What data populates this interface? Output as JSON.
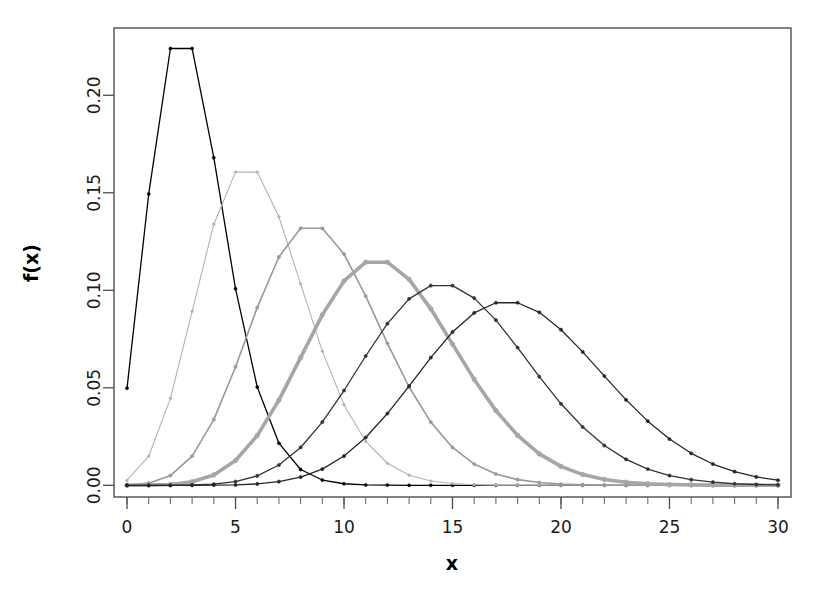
{
  "chart_data": {
    "type": "line",
    "title": "",
    "subtitle": "",
    "xlabel": "x",
    "ylabel": "f(x)",
    "xlim": [
      -0.6,
      30.6
    ],
    "ylim": [
      -0.006,
      0.2345
    ],
    "grid": false,
    "legend": "none",
    "x_ticks": [
      0,
      5,
      10,
      15,
      20,
      25,
      30
    ],
    "x_tick_labels": [
      "0",
      "5",
      "10",
      "15",
      "20",
      "25",
      "30"
    ],
    "x_minor_ticks": [
      0,
      1,
      2,
      3,
      4,
      5,
      6,
      7,
      8,
      9,
      10,
      11,
      12,
      13,
      14,
      15,
      16,
      17,
      18,
      19,
      20,
      21,
      22,
      23,
      24,
      25,
      26,
      27,
      28,
      29,
      30
    ],
    "y_ticks": [
      0.0,
      0.05,
      0.1,
      0.15,
      0.2
    ],
    "y_tick_labels": [
      "0.00",
      "0.05",
      "0.10",
      "0.15",
      "0.20"
    ],
    "x": [
      0,
      1,
      2,
      3,
      4,
      5,
      6,
      7,
      8,
      9,
      10,
      11,
      12,
      13,
      14,
      15,
      16,
      17,
      18,
      19,
      20,
      21,
      22,
      23,
      24,
      25,
      26,
      27,
      28,
      29,
      30
    ],
    "series": [
      {
        "name": "lambda = 3",
        "color": "#000000",
        "width": 1.3,
        "marker_size": 3.0,
        "peak_x": 2,
        "peak_value": 0.224,
        "values": [
          0.0498,
          0.1494,
          0.224,
          0.224,
          0.168,
          0.1008,
          0.0504,
          0.0216,
          0.0081,
          0.0027,
          0.0008,
          0.0002,
          0.0001,
          0.0,
          0.0,
          0.0,
          0.0,
          0.0,
          0.0,
          0.0,
          0.0,
          0.0,
          0.0,
          0.0,
          0.0,
          0.0,
          0.0,
          0.0,
          0.0,
          0.0,
          0.0
        ]
      },
      {
        "name": "lambda = 6",
        "color": "#b3b3b3",
        "width": 1.1,
        "marker_size": 2.6,
        "peak_x": 5,
        "peak_value": 0.1606,
        "values": [
          0.0025,
          0.0149,
          0.0446,
          0.0892,
          0.1339,
          0.1606,
          0.1606,
          0.1377,
          0.1033,
          0.0688,
          0.0413,
          0.0225,
          0.0113,
          0.0052,
          0.0022,
          0.0009,
          0.0003,
          0.0001,
          0.0,
          0.0,
          0.0,
          0.0,
          0.0,
          0.0,
          0.0,
          0.0,
          0.0,
          0.0,
          0.0,
          0.0,
          0.0
        ]
      },
      {
        "name": "lambda = 9",
        "color": "#999999",
        "width": 1.6,
        "marker_size": 3.2,
        "peak_x": 8,
        "peak_value": 0.1318,
        "values": [
          0.0001,
          0.0011,
          0.005,
          0.015,
          0.0337,
          0.0607,
          0.0911,
          0.1171,
          0.1318,
          0.1318,
          0.1186,
          0.097,
          0.0728,
          0.0504,
          0.0324,
          0.0194,
          0.0109,
          0.0058,
          0.0029,
          0.0014,
          0.0006,
          0.0003,
          0.0001,
          0.0,
          0.0,
          0.0,
          0.0,
          0.0,
          0.0,
          0.0,
          0.0
        ]
      },
      {
        "name": "lambda = 12",
        "color": "#a6a6a6",
        "width": 3.6,
        "marker_size": 4.6,
        "peak_x": 11,
        "peak_value": 0.1144,
        "values": [
          0.0,
          0.0001,
          0.0004,
          0.0018,
          0.0053,
          0.0127,
          0.0255,
          0.0437,
          0.0655,
          0.0874,
          0.1048,
          0.1144,
          0.1144,
          0.1056,
          0.0905,
          0.0724,
          0.0543,
          0.0383,
          0.0256,
          0.0161,
          0.0097,
          0.0055,
          0.003,
          0.0016,
          0.0008,
          0.0004,
          0.0002,
          0.0001,
          0.0,
          0.0,
          0.0
        ]
      },
      {
        "name": "lambda = 15",
        "color": "#333333",
        "width": 1.3,
        "marker_size": 3.2,
        "peak_x": 14,
        "peak_value": 0.1024,
        "values": [
          0.0,
          0.0,
          0.0,
          0.0002,
          0.0006,
          0.0019,
          0.0048,
          0.0104,
          0.0194,
          0.0324,
          0.0486,
          0.0663,
          0.0829,
          0.0956,
          0.1024,
          0.1024,
          0.096,
          0.0847,
          0.0706,
          0.0557,
          0.0418,
          0.0299,
          0.0204,
          0.0133,
          0.0083,
          0.005,
          0.0029,
          0.0016,
          0.0008,
          0.0004,
          0.0002
        ]
      },
      {
        "name": "lambda = 18",
        "color": "#262626",
        "width": 1.3,
        "marker_size": 3.2,
        "peak_x": 17,
        "peak_value": 0.0936,
        "values": [
          0.0,
          0.0,
          0.0,
          0.0,
          0.0001,
          0.0002,
          0.0007,
          0.0019,
          0.0042,
          0.0083,
          0.015,
          0.0245,
          0.0368,
          0.0509,
          0.0655,
          0.0786,
          0.0884,
          0.0936,
          0.0936,
          0.0887,
          0.0798,
          0.0684,
          0.056,
          0.0438,
          0.0329,
          0.0237,
          0.0164,
          0.0109,
          0.007,
          0.0043,
          0.0026
        ]
      }
    ]
  },
  "axis": {
    "x_title": "x",
    "y_title": "f(x)"
  }
}
